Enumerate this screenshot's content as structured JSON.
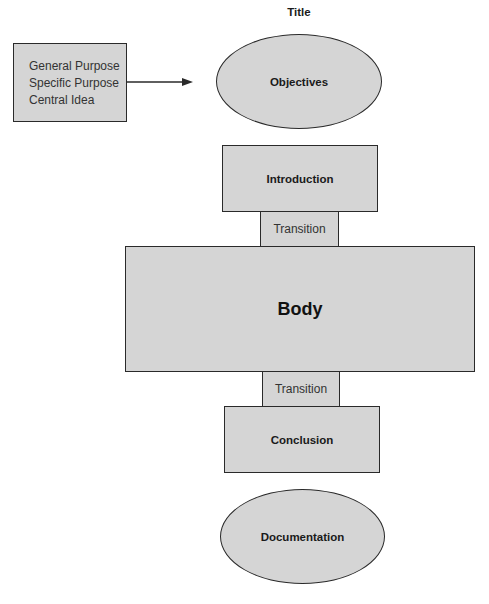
{
  "diagram": {
    "title": "Title",
    "purpose_box": {
      "lines": [
        "General Purpose",
        "Specific Purpose",
        "Central Idea"
      ]
    },
    "nodes": {
      "objectives": "Objectives",
      "introduction": "Introduction",
      "transition_1": "Transition",
      "body": "Body",
      "transition_2": "Transition",
      "conclusion": "Conclusion",
      "documentation": "Documentation"
    },
    "edges": [
      {
        "from": "purpose_box",
        "to": "objectives",
        "type": "arrow"
      }
    ],
    "colors": {
      "fill": "#d5d5d5",
      "stroke": "#2a2a2a",
      "text": "#1a1a1a"
    }
  }
}
